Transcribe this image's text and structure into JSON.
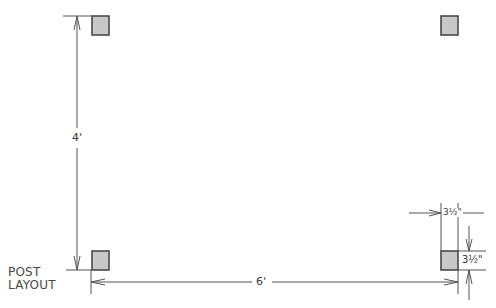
{
  "title": {
    "line1": "POST",
    "line2": "LAYOUT"
  },
  "dimensions": {
    "height": "4'",
    "width": "6'",
    "post_width": "3½\"",
    "post_depth": "3½\""
  },
  "posts": [
    {
      "id": "top-left"
    },
    {
      "id": "top-right"
    },
    {
      "id": "bottom-left"
    },
    {
      "id": "bottom-right"
    }
  ],
  "colors": {
    "post_fill": "#c8c8c8",
    "post_stroke": "#4a4a4a",
    "line": "#555555"
  }
}
